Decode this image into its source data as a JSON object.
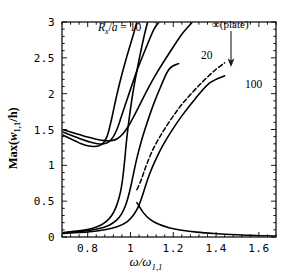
{
  "chart_data": {
    "type": "line",
    "title": "",
    "xlabel": "ω/ω₁,₁",
    "ylabel": "Max(w₁,₁/h)",
    "xlim": [
      0.68,
      1.68
    ],
    "ylim": [
      0,
      3
    ],
    "xticks": [
      0.8,
      1,
      1.2,
      1.4,
      1.6
    ],
    "xtick_labels": [
      "0.8",
      "1",
      "1.2",
      "1.4",
      "1.6"
    ],
    "yticks": [
      0,
      0.5,
      1,
      1.5,
      2,
      2.5,
      3
    ],
    "ytick_labels": [
      "0",
      "0.5",
      "1",
      "1.5",
      "2",
      "2.5",
      "3"
    ],
    "grid": false,
    "legend_position": "inline-annotations",
    "series": [
      {
        "name": "Rx/a = 10 upper branch",
        "style": "solid",
        "points": [
          [
            0.68,
            1.43
          ],
          [
            0.7,
            1.4
          ],
          [
            0.72,
            1.37
          ],
          [
            0.745,
            1.335
          ],
          [
            0.77,
            1.3
          ],
          [
            0.8,
            1.272
          ],
          [
            0.83,
            1.262
          ],
          [
            0.855,
            1.275
          ],
          [
            0.875,
            1.32
          ],
          [
            0.89,
            1.4
          ],
          [
            0.9,
            1.5
          ],
          [
            0.912,
            1.65
          ],
          [
            0.925,
            1.83
          ],
          [
            0.94,
            2.03
          ],
          [
            0.96,
            2.27
          ],
          [
            0.985,
            2.54
          ],
          [
            1.01,
            2.79
          ],
          [
            1.03,
            3.0
          ]
        ]
      },
      {
        "name": "Rx/a = 10 lower branch",
        "style": "solid",
        "points": [
          [
            0.68,
            0.06
          ],
          [
            0.76,
            0.085
          ],
          [
            0.82,
            0.12
          ],
          [
            0.86,
            0.165
          ],
          [
            0.89,
            0.225
          ],
          [
            0.912,
            0.3
          ],
          [
            0.93,
            0.4
          ],
          [
            0.944,
            0.52
          ],
          [
            0.954,
            0.64
          ],
          [
            0.962,
            0.78
          ],
          [
            0.968,
            0.93
          ],
          [
            0.974,
            1.1
          ],
          [
            0.98,
            1.3
          ],
          [
            0.99,
            1.56
          ],
          [
            1.002,
            1.83
          ],
          [
            1.018,
            2.13
          ],
          [
            1.04,
            2.47
          ],
          [
            1.062,
            2.78
          ],
          [
            1.08,
            3.0
          ]
        ]
      },
      {
        "name": "Rx/a = 20 upper branch",
        "style": "solid",
        "points": [
          [
            0.68,
            1.47
          ],
          [
            0.71,
            1.435
          ],
          [
            0.74,
            1.4
          ],
          [
            0.775,
            1.36
          ],
          [
            0.81,
            1.325
          ],
          [
            0.845,
            1.302
          ],
          [
            0.875,
            1.3
          ],
          [
            0.9,
            1.33
          ],
          [
            0.92,
            1.4
          ],
          [
            0.938,
            1.51
          ],
          [
            0.955,
            1.66
          ],
          [
            0.975,
            1.84
          ],
          [
            1.0,
            2.06
          ],
          [
            1.03,
            2.32
          ],
          [
            1.07,
            2.62
          ],
          [
            1.11,
            2.9
          ],
          [
            1.135,
            3.0
          ]
        ]
      },
      {
        "name": "Rx/a = 20 lower branch",
        "style": "solid",
        "points": [
          [
            0.68,
            0.055
          ],
          [
            0.78,
            0.08
          ],
          [
            0.85,
            0.115
          ],
          [
            0.9,
            0.165
          ],
          [
            0.935,
            0.235
          ],
          [
            0.96,
            0.33
          ],
          [
            0.978,
            0.45
          ],
          [
            0.992,
            0.59
          ],
          [
            1.004,
            0.74
          ],
          [
            1.016,
            0.91
          ],
          [
            1.03,
            1.1
          ],
          [
            1.05,
            1.33
          ],
          [
            1.075,
            1.57
          ],
          [
            1.105,
            1.83
          ],
          [
            1.14,
            2.09
          ],
          [
            1.18,
            2.34
          ],
          [
            1.225,
            2.42
          ]
        ]
      },
      {
        "name": "Rx/a = 100 upper branch",
        "style": "solid",
        "points": [
          [
            0.68,
            1.5
          ],
          [
            0.72,
            1.465
          ],
          [
            0.76,
            1.43
          ],
          [
            0.8,
            1.395
          ],
          [
            0.84,
            1.365
          ],
          [
            0.88,
            1.345
          ],
          [
            0.912,
            1.345
          ],
          [
            0.94,
            1.375
          ],
          [
            0.965,
            1.44
          ],
          [
            0.99,
            1.545
          ],
          [
            1.015,
            1.68
          ],
          [
            1.045,
            1.855
          ],
          [
            1.08,
            2.06
          ],
          [
            1.125,
            2.3
          ],
          [
            1.18,
            2.56
          ],
          [
            1.24,
            2.83
          ],
          [
            1.29,
            3.0
          ]
        ]
      },
      {
        "name": "Rx/a = 100 lower branch",
        "style": "solid",
        "points": [
          [
            0.68,
            0.05
          ],
          [
            0.8,
            0.07
          ],
          [
            0.88,
            0.1
          ],
          [
            0.94,
            0.145
          ],
          [
            0.985,
            0.215
          ],
          [
            1.015,
            0.31
          ],
          [
            1.038,
            0.43
          ],
          [
            1.055,
            0.57
          ],
          [
            1.072,
            0.73
          ],
          [
            1.092,
            0.9
          ],
          [
            1.118,
            1.08
          ],
          [
            1.15,
            1.27
          ],
          [
            1.19,
            1.47
          ],
          [
            1.24,
            1.69
          ],
          [
            1.3,
            1.92
          ],
          [
            1.37,
            2.15
          ],
          [
            1.44,
            2.25
          ]
        ]
      },
      {
        "name": "infinity (plate) dashed",
        "style": "dashed",
        "points": [
          [
            1.03,
            0.66
          ],
          [
            1.048,
            0.78
          ],
          [
            1.062,
            0.9
          ],
          [
            1.078,
            1.03
          ],
          [
            1.1,
            1.19
          ],
          [
            1.128,
            1.35
          ],
          [
            1.16,
            1.51
          ],
          [
            1.198,
            1.68
          ],
          [
            1.24,
            1.85
          ],
          [
            1.29,
            2.02
          ],
          [
            1.345,
            2.19
          ],
          [
            1.4,
            2.34
          ],
          [
            1.44,
            2.43
          ]
        ]
      },
      {
        "name": "decaying tail bundle",
        "style": "solid",
        "points": [
          [
            1.03,
            0.48
          ],
          [
            1.06,
            0.34
          ],
          [
            1.09,
            0.25
          ],
          [
            1.13,
            0.18
          ],
          [
            1.18,
            0.13
          ],
          [
            1.24,
            0.095
          ],
          [
            1.31,
            0.068
          ],
          [
            1.39,
            0.048
          ],
          [
            1.47,
            0.034
          ],
          [
            1.56,
            0.022
          ],
          [
            1.68,
            0.012
          ]
        ]
      }
    ],
    "annotations": [
      {
        "id": "rx",
        "text": "R_x/a = 10",
        "x": 0.86,
        "y": 2.85
      },
      {
        "id": "c20",
        "text": "20",
        "x": 1.28,
        "y": 2.5
      },
      {
        "id": "c100",
        "text": "100",
        "x": 1.5,
        "y": 2.12
      },
      {
        "id": "inf",
        "text": "∞(plate)",
        "x": 1.55,
        "y": 2.9
      }
    ]
  },
  "labels": {
    "rx_prefix": "R",
    "rx_sub": "x",
    "rx_suffix": "/",
    "rx_a": "a",
    "rx_eq": " = 10",
    "curve_20": "20",
    "curve_100": "100",
    "infinity_plate": "∞(plate)",
    "ylabel_prefix": "Max(",
    "ylabel_w": "w",
    "ylabel_sub": "1,1",
    "ylabel_suffix": "/h)",
    "xlabel_omega": "ω/ω",
    "xlabel_sub": "1,1"
  },
  "colors": {
    "curve": "#000000",
    "axis": "#000000",
    "background": "#ffffff",
    "text": "#1a1a1a"
  }
}
